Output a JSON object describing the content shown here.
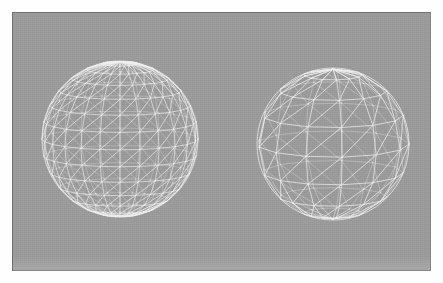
{
  "scene": {
    "title": "Sphere mesh comparison",
    "background_color": "#9b9b9b",
    "page_color": "#fefefe",
    "border_color": "#6f6f6f",
    "wire_color": "#f2f2f2",
    "canvas": {
      "width": 443,
      "height": 283
    },
    "viewport": {
      "x": 12,
      "y": 12,
      "width": 419,
      "height": 259
    },
    "objects": [
      {
        "name": "sphere-high-resolution",
        "label": "",
        "kind": "uv-sphere-wireframe",
        "center_x": 119,
        "center_y": 138,
        "radius": 78,
        "segments_u": 24,
        "segments_v": 14,
        "triangulated": true,
        "line_width": 0.7,
        "tilt_degrees": 8
      },
      {
        "name": "sphere-low-resolution",
        "label": "",
        "kind": "uv-sphere-wireframe",
        "center_x": 332,
        "center_y": 143,
        "radius": 76,
        "segments_u": 13,
        "segments_v": 8,
        "triangulated": true,
        "line_width": 0.8,
        "tilt_degrees": 10
      }
    ]
  }
}
